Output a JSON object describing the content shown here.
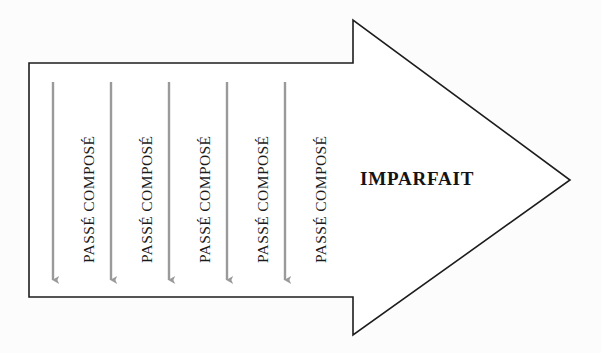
{
  "diagram": {
    "type": "timeline-arrow-diagram",
    "background_color": "#fdfcfc",
    "outline_color": "#1d1d1d",
    "outline_width": 1.6,
    "shape": {
      "name": "right-pointing-block-arrow",
      "shaft_left": 29,
      "shaft_top": 63,
      "shaft_bottom": 297,
      "notch_x": 353,
      "head_top": 20,
      "head_bottom": 335,
      "tip_x": 570,
      "tip_y": 180
    },
    "head_label": {
      "text": "IMPARFAIT",
      "color": "#141414",
      "font_size": 19,
      "bold": true,
      "x": 360,
      "y": 168
    },
    "down_arrows": {
      "count": 5,
      "color": "#9a9a9a",
      "stroke_width": 2.4,
      "top_y": 82,
      "tip_y": 287,
      "x_positions": [
        53,
        111,
        169,
        227,
        285
      ]
    },
    "column_labels": [
      {
        "text": "PASSÉ COMPOSÉ",
        "x": 80,
        "bottom_y": 263
      },
      {
        "text": "PASSÉ COMPOSÉ",
        "x": 138,
        "bottom_y": 263
      },
      {
        "text": "PASSÉ COMPOSÉ",
        "x": 196,
        "bottom_y": 263
      },
      {
        "text": "PASSÉ COMPOSÉ",
        "x": 254,
        "bottom_y": 263
      },
      {
        "text": "PASSÉ COMPOSÉ",
        "x": 312,
        "bottom_y": 263
      }
    ]
  }
}
